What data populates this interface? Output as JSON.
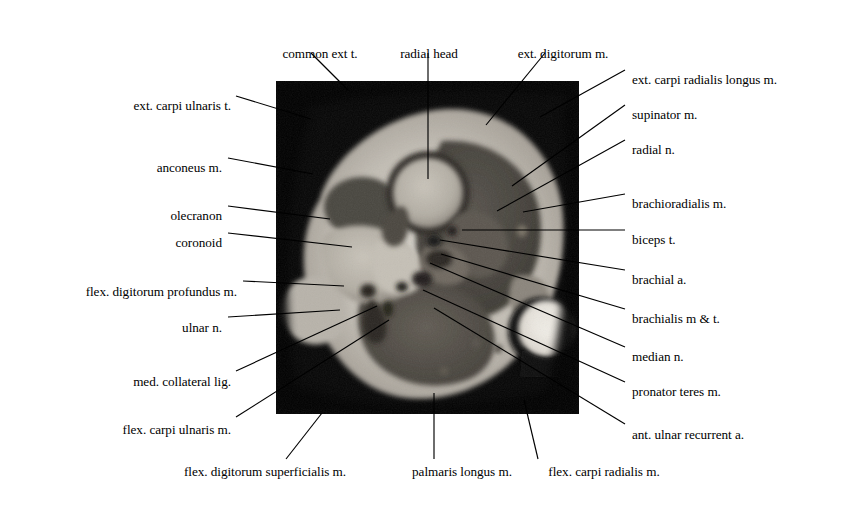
{
  "figure": {
    "image_kind": "mri-axial-elbow",
    "plate": {
      "x": 276,
      "y": 81,
      "width": 303,
      "height": 333,
      "background": "#050505"
    },
    "text_color": "#000000",
    "leader_color": "#000000",
    "page_background": "#ffffff"
  },
  "labels": [
    {
      "id": "common-ext-t",
      "text": "common ext t.",
      "side": "top",
      "align": "center",
      "tx": 320,
      "ty": 47,
      "line": [
        [
          311,
          53
        ],
        [
          348,
          90
        ]
      ]
    },
    {
      "id": "radial-head",
      "text": "radial head",
      "side": "top",
      "align": "center",
      "tx": 429,
      "ty": 47,
      "line": [
        [
          428,
          53
        ],
        [
          428,
          179
        ]
      ]
    },
    {
      "id": "ext-digitorum-m",
      "text": "ext. digitorum m.",
      "side": "top",
      "align": "center",
      "tx": 563,
      "ty": 47,
      "line": [
        [
          545,
          53
        ],
        [
          486,
          125
        ]
      ]
    },
    {
      "id": "ext-carpi-ulnaris-t",
      "text": "ext. carpi ulnaris t.",
      "side": "left",
      "align": "right",
      "tx": 231,
      "ty": 99,
      "line": [
        [
          236,
          96
        ],
        [
          311,
          119
        ]
      ]
    },
    {
      "id": "anconeus-m",
      "text": "anconeus m.",
      "side": "left",
      "align": "right",
      "tx": 222,
      "ty": 161,
      "line": [
        [
          228,
          158
        ],
        [
          313,
          174
        ]
      ]
    },
    {
      "id": "olecranon",
      "text": "olecranon",
      "side": "left",
      "align": "right",
      "tx": 222,
      "ty": 209,
      "line": [
        [
          228,
          206
        ],
        [
          330,
          219
        ]
      ]
    },
    {
      "id": "coronoid",
      "text": "coronoid",
      "side": "left",
      "align": "right",
      "tx": 222,
      "ty": 236,
      "line": [
        [
          228,
          233
        ],
        [
          352,
          247
        ]
      ]
    },
    {
      "id": "flex-digitorum-profundus-m",
      "text": "flex. digitorum profundus  m.",
      "side": "left",
      "align": "right",
      "tx": 237,
      "ty": 285,
      "line": [
        [
          243,
          281
        ],
        [
          344,
          286
        ]
      ]
    },
    {
      "id": "ulnar-n",
      "text": "ulnar n.",
      "side": "left",
      "align": "right",
      "tx": 222,
      "ty": 321,
      "line": [
        [
          228,
          317
        ],
        [
          340,
          310
        ]
      ]
    },
    {
      "id": "med-collateral-lig",
      "text": "med. collateral lig.",
      "side": "left",
      "align": "right",
      "tx": 231,
      "ty": 375,
      "line": [
        [
          236,
          371
        ],
        [
          377,
          306
        ]
      ]
    },
    {
      "id": "flex-carpi-ulnaris-m",
      "text": "flex. carpi ulnaris m.",
      "side": "left",
      "align": "right",
      "tx": 231,
      "ty": 423,
      "line": [
        [
          236,
          417
        ],
        [
          389,
          320
        ]
      ]
    },
    {
      "id": "ext-carpi-radialis-longus-m",
      "text": "ext. carpi radialis longus  m.",
      "side": "right",
      "align": "left",
      "tx": 632,
      "ty": 73,
      "line": [
        [
          625,
          70
        ],
        [
          540,
          117
        ]
      ]
    },
    {
      "id": "supinator-m",
      "text": "supinator m.",
      "side": "right",
      "align": "left",
      "tx": 632,
      "ty": 108,
      "line": [
        [
          625,
          105
        ],
        [
          512,
          186
        ]
      ]
    },
    {
      "id": "radial-n",
      "text": "radial n.",
      "side": "right",
      "align": "left",
      "tx": 632,
      "ty": 143,
      "line": [
        [
          625,
          140
        ],
        [
          497,
          211
        ]
      ]
    },
    {
      "id": "brachioradialis-m",
      "text": "brachioradialis m.",
      "side": "right",
      "align": "left",
      "tx": 632,
      "ty": 197,
      "line": [
        [
          625,
          194
        ],
        [
          523,
          212
        ]
      ]
    },
    {
      "id": "biceps-t",
      "text": "biceps t.",
      "side": "right",
      "align": "left",
      "tx": 632,
      "ty": 233,
      "line": [
        [
          625,
          230
        ],
        [
          462,
          230
        ]
      ]
    },
    {
      "id": "brachial-a",
      "text": "brachial a.",
      "side": "right",
      "align": "left",
      "tx": 632,
      "ty": 273,
      "line": [
        [
          625,
          270
        ],
        [
          440,
          240
        ]
      ]
    },
    {
      "id": "brachialis-m-t",
      "text": "brachialis m & t.",
      "side": "right",
      "align": "left",
      "tx": 632,
      "ty": 312,
      "line": [
        [
          625,
          309
        ],
        [
          441,
          254
        ]
      ]
    },
    {
      "id": "median-n",
      "text": "median n.",
      "side": "right",
      "align": "left",
      "tx": 632,
      "ty": 350,
      "line": [
        [
          625,
          347
        ],
        [
          430,
          263
        ]
      ]
    },
    {
      "id": "pronator-teres-m",
      "text": "pronator teres m.",
      "side": "right",
      "align": "left",
      "tx": 632,
      "ty": 385,
      "line": [
        [
          625,
          382
        ],
        [
          423,
          290
        ]
      ]
    },
    {
      "id": "ant-ulnar-recurrent-a",
      "text": "ant. ulnar recurrent a.",
      "side": "right",
      "align": "left",
      "tx": 632,
      "ty": 428,
      "line": [
        [
          625,
          424
        ],
        [
          434,
          308
        ]
      ]
    },
    {
      "id": "flex-digitorum-superficialis-m",
      "text": "flex. digitorum superficialis  m.",
      "side": "bottom",
      "align": "center",
      "tx": 265,
      "ty": 465,
      "line": [
        [
          286,
          459
        ],
        [
          322,
          413
        ]
      ]
    },
    {
      "id": "palmaris-longus-m",
      "text": "palmaris longus m.",
      "side": "bottom",
      "align": "center",
      "tx": 462,
      "ty": 465,
      "line": [
        [
          434,
          459
        ],
        [
          434,
          393
        ]
      ]
    },
    {
      "id": "flex-carpi-radialis-m",
      "text": "flex. carpi radialis m.",
      "side": "bottom",
      "align": "center",
      "tx": 604,
      "ty": 465,
      "line": [
        [
          538,
          459
        ],
        [
          524,
          400
        ]
      ]
    }
  ]
}
